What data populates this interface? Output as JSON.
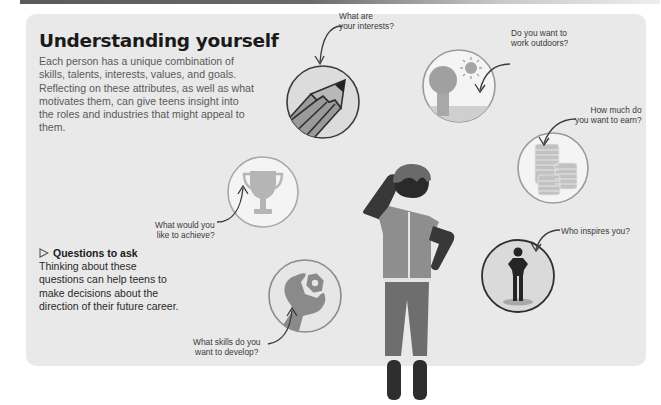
{
  "header": {
    "title": "Understanding yourself",
    "intro": "Each person has a unique combination of skills, talents, interests, values, and goals. Reflecting on these attributes, as well as what motivates them, can give teens insight into the roles and industries that might appeal to them."
  },
  "questions_box": {
    "icon": "triangle-right-outline-icon",
    "heading": "Questions to ask",
    "body": "Thinking about these questions can help teens to make decisions about the direction of their future career."
  },
  "questions": [
    {
      "id": "interests",
      "icon": "pencil-icon",
      "line1": "What are",
      "line2": "your interests?"
    },
    {
      "id": "outdoors",
      "icon": "tree-sun-icon",
      "line1": "Do you want to",
      "line2": "work outdoors?"
    },
    {
      "id": "earn",
      "icon": "coins-icon",
      "line1": "How much do",
      "line2": "you want to earn?"
    },
    {
      "id": "achieve",
      "icon": "trophy-icon",
      "line1": "What would you",
      "line2": "like to achieve?"
    },
    {
      "id": "inspires",
      "icon": "person-icon",
      "line1": "Who inspires you?",
      "line2": ""
    },
    {
      "id": "skills",
      "icon": "wrench-icon",
      "line1": "What skills do you",
      "line2": "want to develop?"
    }
  ],
  "colors": {
    "card_bg": "#e9e9e9",
    "circle_fill": "#f2f2f2",
    "circle_stroke": "#9a9a9a",
    "dark": "#3a3a3a",
    "mid": "#8a8a8a",
    "light": "#b5b5b5"
  }
}
